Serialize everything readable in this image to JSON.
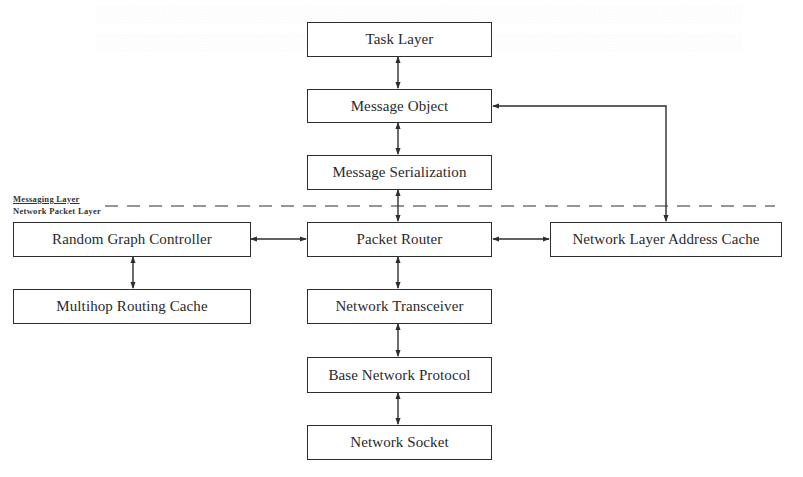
{
  "diagram": {
    "type": "layered-architecture-block-diagram",
    "layer_labels": {
      "upper": "Messaging Layer",
      "lower": "Network Packet Layer"
    },
    "nodes": [
      {
        "id": "task_layer",
        "label": "Task Layer",
        "column": "center",
        "layer": "messaging"
      },
      {
        "id": "message_object",
        "label": "Message Object",
        "column": "center",
        "layer": "messaging"
      },
      {
        "id": "message_serialization",
        "label": "Message Serialization",
        "column": "center",
        "layer": "messaging"
      },
      {
        "id": "random_graph_controller",
        "label": "Random Graph Controller",
        "column": "left",
        "layer": "network-packet"
      },
      {
        "id": "packet_router",
        "label": "Packet Router",
        "column": "center",
        "layer": "network-packet"
      },
      {
        "id": "network_layer_address_cache",
        "label": "Network Layer Address Cache",
        "column": "right",
        "layer": "network-packet"
      },
      {
        "id": "multihop_routing_cache",
        "label": "Multihop Routing Cache",
        "column": "left",
        "layer": "network-packet"
      },
      {
        "id": "network_transceiver",
        "label": "Network Transceiver",
        "column": "center",
        "layer": "network-packet"
      },
      {
        "id": "base_network_protocol",
        "label": "Base Network Protocol",
        "column": "center",
        "layer": "network-packet"
      },
      {
        "id": "network_socket",
        "label": "Network Socket",
        "column": "center",
        "layer": "network-packet"
      }
    ],
    "edges": [
      {
        "from": "task_layer",
        "to": "message_object",
        "style": "bidirectional"
      },
      {
        "from": "message_object",
        "to": "message_serialization",
        "style": "bidirectional"
      },
      {
        "from": "message_serialization",
        "to": "packet_router",
        "style": "bidirectional"
      },
      {
        "from": "random_graph_controller",
        "to": "packet_router",
        "style": "bidirectional"
      },
      {
        "from": "packet_router",
        "to": "network_layer_address_cache",
        "style": "bidirectional"
      },
      {
        "from": "network_layer_address_cache",
        "to": "message_object",
        "style": "bidirectional-elbow"
      },
      {
        "from": "random_graph_controller",
        "to": "multihop_routing_cache",
        "style": "bidirectional"
      },
      {
        "from": "packet_router",
        "to": "network_transceiver",
        "style": "bidirectional"
      },
      {
        "from": "network_transceiver",
        "to": "base_network_protocol",
        "style": "bidirectional"
      },
      {
        "from": "base_network_protocol",
        "to": "network_socket",
        "style": "bidirectional"
      }
    ],
    "separator": {
      "style": "dashed",
      "between": [
        "Messaging Layer",
        "Network Packet Layer"
      ]
    }
  },
  "labels": {
    "task_layer": "Task Layer",
    "message_object": "Message Object",
    "message_serialization": "Message Serialization",
    "random_graph_controller": "Random Graph Controller",
    "packet_router": "Packet Router",
    "network_layer_address_cache": "Network Layer Address Cache",
    "multihop_routing_cache": "Multihop Routing Cache",
    "network_transceiver": "Network Transceiver",
    "base_network_protocol": "Base Network Protocol",
    "network_socket": "Network Socket",
    "messaging_layer": "Messaging Layer",
    "network_packet_layer": "Network Packet Layer"
  },
  "colors": {
    "line": "#2e2e2e",
    "background": "#ffffff"
  }
}
